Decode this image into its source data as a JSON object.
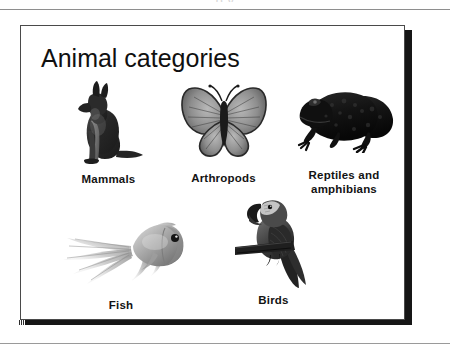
{
  "document": {
    "top_rule": true,
    "bottom_rule": true,
    "top_ghost_text": "p y"
  },
  "slide": {
    "title": "Animal categories",
    "background_color": "#ffffff",
    "border_color": "#4a4a4a",
    "shadow_color": "#161616",
    "items": [
      {
        "id": "mammals",
        "caption": "Mammals",
        "image_name": "german-shepherd-dog-photo",
        "image_alt": "Sitting German Shepherd dog, grayscale photo"
      },
      {
        "id": "arthropods",
        "caption": "Arthropods",
        "image_name": "butterfly-photo",
        "image_alt": "Butterfly with spread wings, grayscale photo"
      },
      {
        "id": "reptiles",
        "caption": "Reptiles and\namphibians",
        "image_name": "frog-photo",
        "image_alt": "Dark frog or toad in profile, grayscale photo"
      },
      {
        "id": "fish",
        "caption": "Fish",
        "image_name": "goldfish-photo",
        "image_alt": "Goldfish with long flowing tail, grayscale photo"
      },
      {
        "id": "birds",
        "caption": "Birds",
        "image_name": "macaw-parrot-photo",
        "image_alt": "Macaw parrot perched on a branch, grayscale photo"
      }
    ]
  },
  "colors": {
    "text": "#101010",
    "rule": "#8e8e8e",
    "caption": "#131313"
  }
}
